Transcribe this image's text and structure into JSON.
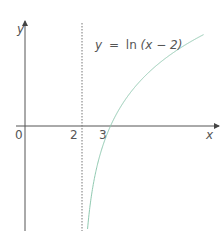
{
  "chart_data": {
    "type": "line",
    "title": "",
    "equation_label": "y = ln(x − 2)",
    "equation_parts": {
      "lhs": "y",
      "eq": "=",
      "fn": "ln",
      "arg": "(x − 2)"
    },
    "xlabel": "x",
    "ylabel": "y",
    "x_tick_labels": [
      "0",
      "2",
      "3"
    ],
    "x_ticks": [
      0,
      2,
      3
    ],
    "asymptote": {
      "x": 2,
      "style": "dotted"
    },
    "x_intercept": 3,
    "series": [
      {
        "name": "y = ln(x − 2)",
        "color": "#8fc9b0",
        "x": [
          2.03,
          2.1,
          2.25,
          2.5,
          3,
          3.5,
          4,
          5,
          6.25
        ],
        "y": [
          -3.5,
          -2.3,
          -1.39,
          -0.69,
          0,
          0.41,
          0.69,
          1.1,
          1.45
        ]
      }
    ],
    "grid": false,
    "xlim": [
      -0.3,
      6.9
    ],
    "ylim": [
      -1.7,
      1.7
    ]
  },
  "colors": {
    "axis": "#555555",
    "curve": "#8fc9b0",
    "asymptote": "#777777"
  }
}
